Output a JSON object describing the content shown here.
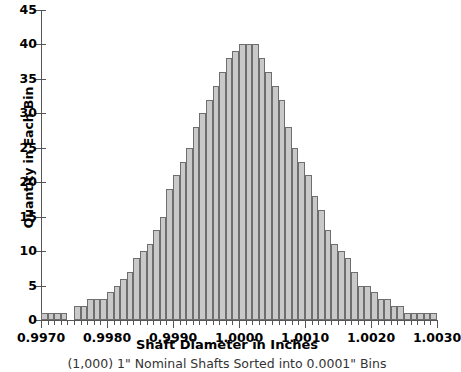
{
  "chart_data": {
    "type": "bar",
    "title": "",
    "subtitle": "(1,000) 1\" Nominal Shafts Sorted into 0.0001\" Bins",
    "xlabel": "Shaft Diameter in Inches",
    "ylabel": "Quantity in Each Bin",
    "xlim": [
      0.997,
      1.003
    ],
    "ylim": [
      0,
      45
    ],
    "bin_width": 0.0001,
    "grid": false,
    "legend": null,
    "bar_fill_color": "#c9c9c9",
    "bar_edge_color": "#6e6e6e",
    "axis_color": "#555555",
    "ytick_labels": [
      "0",
      "5",
      "10",
      "15",
      "20",
      "25",
      "30",
      "35",
      "40",
      "45"
    ],
    "ytick_values": [
      0,
      5,
      10,
      15,
      20,
      25,
      30,
      35,
      40,
      45
    ],
    "xtick_labels": [
      "0.9970",
      "0.9980",
      "0.9990",
      "1.0000",
      "1.0010",
      "1.0020",
      "1.0030"
    ],
    "xtick_values": [
      0.997,
      0.998,
      0.999,
      1.0,
      1.001,
      1.002,
      1.003
    ],
    "xtick_minor_step": 0.0001,
    "categories": [
      "0.9970",
      "0.9971",
      "0.9972",
      "0.9973",
      "0.9974",
      "0.9975",
      "0.9976",
      "0.9977",
      "0.9978",
      "0.9979",
      "0.9980",
      "0.9981",
      "0.9982",
      "0.9983",
      "0.9984",
      "0.9985",
      "0.9986",
      "0.9987",
      "0.9988",
      "0.9989",
      "0.9990",
      "0.9991",
      "0.9992",
      "0.9993",
      "0.9994",
      "0.9995",
      "0.9996",
      "0.9997",
      "0.9998",
      "0.9999",
      "1.0000",
      "1.0001",
      "1.0002",
      "1.0003",
      "1.0004",
      "1.0005",
      "1.0006",
      "1.0007",
      "1.0008",
      "1.0009",
      "1.0010",
      "1.0011",
      "1.0012",
      "1.0013",
      "1.0014",
      "1.0015",
      "1.0016",
      "1.0017",
      "1.0018",
      "1.0019",
      "1.0020",
      "1.0021",
      "1.0022",
      "1.0023",
      "1.0024",
      "1.0025",
      "1.0026",
      "1.0027",
      "1.0028",
      "1.0029"
    ],
    "values": [
      1,
      1,
      1,
      1,
      0,
      2,
      2,
      3,
      3,
      3,
      4,
      5,
      6,
      7,
      9,
      10,
      11,
      13,
      15,
      19,
      21,
      23,
      25,
      28,
      30,
      32,
      34,
      36,
      38,
      39,
      40,
      40,
      40,
      38,
      36,
      34,
      32,
      28,
      25,
      23,
      21,
      18,
      16,
      13,
      11,
      10,
      9,
      7,
      5,
      5,
      4,
      3,
      3,
      2,
      2,
      1,
      1,
      1,
      1,
      1
    ]
  }
}
